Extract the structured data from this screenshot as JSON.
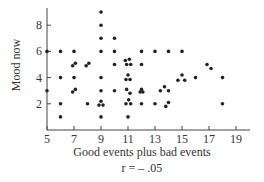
{
  "chart_data": {
    "type": "scatter",
    "title": "",
    "xlabel": "Good events plus bad events",
    "ylabel": "Mood now",
    "annotation": "r = – .05",
    "xlim": [
      5,
      20
    ],
    "ylim": [
      0,
      9.5
    ],
    "xticks": [
      5,
      7,
      9,
      11,
      13,
      15,
      17,
      19
    ],
    "yticks": [
      2,
      4,
      6,
      8
    ],
    "grid": false,
    "legend": null,
    "points": [
      [
        5,
        6
      ],
      [
        5,
        3
      ],
      [
        6,
        6
      ],
      [
        6,
        4
      ],
      [
        6,
        2
      ],
      [
        6,
        1
      ],
      [
        7,
        6
      ],
      [
        6.9,
        4.9
      ],
      [
        7.1,
        5.1
      ],
      [
        7,
        4
      ],
      [
        6.9,
        2.9
      ],
      [
        7.1,
        3.1
      ],
      [
        7.9,
        4.9
      ],
      [
        8.1,
        5.1
      ],
      [
        8,
        2
      ],
      [
        9,
        9
      ],
      [
        9,
        8
      ],
      [
        9,
        7
      ],
      [
        9,
        6
      ],
      [
        9,
        4
      ],
      [
        9,
        3
      ],
      [
        8.85,
        1.9
      ],
      [
        9.15,
        1.9
      ],
      [
        9,
        2.2
      ],
      [
        9,
        1
      ],
      [
        10,
        7
      ],
      [
        10,
        6
      ],
      [
        10,
        5
      ],
      [
        10,
        3
      ],
      [
        10.8,
        5.3
      ],
      [
        11.1,
        5.4
      ],
      [
        10.9,
        5
      ],
      [
        11.2,
        5
      ],
      [
        11,
        4.2
      ],
      [
        10.85,
        3.85
      ],
      [
        11.15,
        3.85
      ],
      [
        10.9,
        3.1
      ],
      [
        11.15,
        2.8
      ],
      [
        10.85,
        2
      ],
      [
        11.05,
        2.3
      ],
      [
        11.2,
        2
      ],
      [
        11,
        1
      ],
      [
        12,
        6
      ],
      [
        12,
        5
      ],
      [
        11.9,
        2.9
      ],
      [
        12.1,
        2.9
      ],
      [
        12,
        3.1
      ],
      [
        12,
        2
      ],
      [
        13,
        6
      ],
      [
        13,
        2
      ],
      [
        13.4,
        3
      ],
      [
        13.7,
        3.3
      ],
      [
        14,
        3
      ],
      [
        13.8,
        1.8
      ],
      [
        14,
        2.1
      ],
      [
        14,
        6
      ],
      [
        15,
        6
      ],
      [
        14.7,
        3.8
      ],
      [
        15,
        4.2
      ],
      [
        15.2,
        3.8
      ],
      [
        16,
        4
      ],
      [
        16.85,
        5
      ],
      [
        17.15,
        4.7
      ],
      [
        18,
        4
      ],
      [
        18,
        2
      ]
    ]
  }
}
